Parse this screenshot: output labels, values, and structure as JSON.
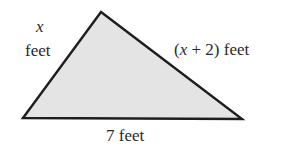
{
  "figure": {
    "shape": "triangle",
    "fill_color": "#e4e4e4",
    "stroke_color": "#1e1e1e",
    "vertices": {
      "left": [
        23,
        118
      ],
      "top": [
        101,
        12
      ],
      "right": [
        242,
        119
      ]
    }
  },
  "labels": {
    "left_side_var": "x",
    "left_side_unit": "feet",
    "right_side_open": "(",
    "right_side_var": "x",
    "right_side_rest": " + 2) feet",
    "bottom_side": "7 feet"
  }
}
